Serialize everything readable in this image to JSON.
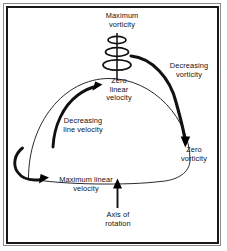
{
  "figure": {
    "type": "diagram",
    "background_color": "#ffffff",
    "line_color": "#101114",
    "frame": {
      "outer_border_color": "#8a8a8a",
      "inner_border_color": "#17181a"
    }
  },
  "labels": {
    "maximum_vorticity": "Maximum\nvorticity",
    "zero_linear_velocity": "Zero\nlinear\nvelocity",
    "decreasing_vorticity": "Decreasing\nvorticity",
    "zero_vorticity": "Zero\nvorticity",
    "decreasing_line_velocity": "Decreasing\nline velocity",
    "maximum_linear_velocity": "Maximum linear\nvelocity",
    "axis_of_rotation": "Axis of\nrotation"
  },
  "shapes": {
    "dome": "half-dome-outline",
    "spiral_coils": 3,
    "axis_line": "vertical-rotation-axis",
    "arrows": [
      {
        "name": "decreasing-vorticity-arrow",
        "from": "spiral-top-right",
        "to": "zero-vorticity",
        "style": "thick-curved"
      },
      {
        "name": "decreasing-line-velocity-arrow",
        "from": "dome-base-left",
        "to": "dome-apex",
        "style": "thick-curved"
      },
      {
        "name": "maximum-linear-velocity-arrow",
        "from": "dome-left-edge",
        "to": "maximum-linear-velocity-label",
        "style": "thick-hooked"
      },
      {
        "name": "axis-of-rotation-arrow",
        "from": "axis-of-rotation-label",
        "to": "dome-base-center",
        "style": "straight-up"
      }
    ]
  }
}
